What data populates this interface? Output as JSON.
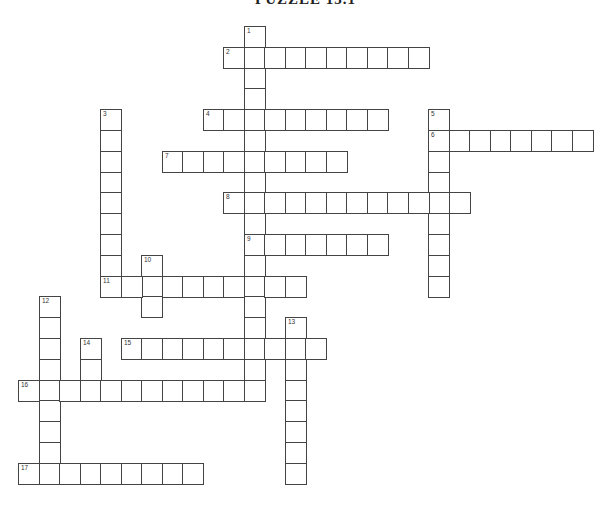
{
  "title": "PUZZLE 15.1",
  "grid": {
    "origin_x": 18,
    "origin_y": 26,
    "cell_w": 20.5,
    "cell_h": 20.8,
    "line_color": "#444444"
  },
  "entries": [
    {
      "number": "1",
      "direction": "down",
      "col": 11,
      "row": 0,
      "length": 18
    },
    {
      "number": "2",
      "direction": "across",
      "col": 10,
      "row": 1,
      "length": 10
    },
    {
      "number": "3",
      "direction": "down",
      "col": 4,
      "row": 4,
      "length": 9
    },
    {
      "number": "4",
      "direction": "across",
      "col": 9,
      "row": 4,
      "length": 9
    },
    {
      "number": "5",
      "direction": "down",
      "col": 20,
      "row": 4,
      "length": 9
    },
    {
      "number": "6",
      "direction": "across",
      "col": 20,
      "row": 5,
      "length": 8
    },
    {
      "number": "7",
      "direction": "across",
      "col": 7,
      "row": 6,
      "length": 9
    },
    {
      "number": "8",
      "direction": "across",
      "col": 10,
      "row": 8,
      "length": 12
    },
    {
      "number": "9",
      "direction": "across",
      "col": 11,
      "row": 10,
      "length": 7
    },
    {
      "number": "10",
      "direction": "down",
      "col": 6,
      "row": 11,
      "length": 3
    },
    {
      "number": "11",
      "direction": "across",
      "col": 4,
      "row": 12,
      "length": 10
    },
    {
      "number": "12",
      "direction": "down",
      "col": 1,
      "row": 13,
      "length": 9
    },
    {
      "number": "13",
      "direction": "down",
      "col": 13,
      "row": 14,
      "length": 8
    },
    {
      "number": "14",
      "direction": "down",
      "col": 3,
      "row": 15,
      "length": 3
    },
    {
      "number": "15",
      "direction": "across",
      "col": 5,
      "row": 15,
      "length": 10
    },
    {
      "number": "16",
      "direction": "across",
      "col": 0,
      "row": 17,
      "length": 12
    },
    {
      "number": "17",
      "direction": "across",
      "col": 0,
      "row": 21,
      "length": 9
    }
  ]
}
